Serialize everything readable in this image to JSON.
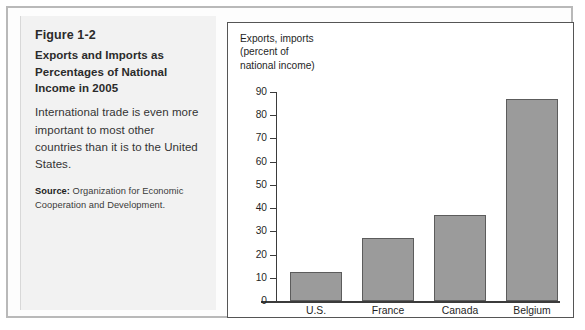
{
  "figure": {
    "number": "Figure 1-2",
    "title": "Exports and Imports as Percentages of National Income in 2005",
    "description": "International trade is even more important to most other countries than it is to the United States.",
    "source_label": "Source:",
    "source_text": " Organization for Economic Cooperation and Development."
  },
  "chart_data": {
    "type": "bar",
    "title": "Exports and Imports as Percentages of National Income in 2005",
    "axis_caption": "Exports, imports\n(percent of\nnational income)",
    "categories": [
      "U.S.",
      "France",
      "Canada",
      "Belgium"
    ],
    "values": [
      12.5,
      27,
      37,
      87
    ],
    "xlabel": "",
    "ylabel": "Exports, imports (percent of national income)",
    "ylim": [
      0,
      90
    ],
    "yticks": [
      0,
      10,
      20,
      30,
      40,
      50,
      60,
      70,
      80,
      90
    ],
    "ytick_labels": [
      "0",
      "10",
      "20",
      "30",
      "40",
      "50",
      "60",
      "70",
      "80",
      "90"
    ],
    "grid": false,
    "legend": null,
    "bar_color": "#9b9b9b",
    "bar_edge_color": "#5c5c5c",
    "axis_color": "#3b3b3b",
    "plot_background": "#ffffff"
  }
}
